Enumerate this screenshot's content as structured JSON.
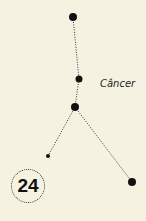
{
  "constellation": {
    "name": "Câncer",
    "stars": [
      {
        "x": 73,
        "y": 17,
        "r": 4
      },
      {
        "x": 79,
        "y": 79,
        "r": 3.5
      },
      {
        "x": 75,
        "y": 107,
        "r": 4
      },
      {
        "x": 48,
        "y": 156,
        "r": 2
      },
      {
        "x": 132,
        "y": 182,
        "r": 4
      }
    ],
    "lines": [
      [
        0,
        1
      ],
      [
        1,
        2
      ],
      [
        2,
        3
      ],
      [
        2,
        4
      ]
    ],
    "star_color": "#111111",
    "line_color": "#333333"
  },
  "badge": {
    "number": "24"
  },
  "background_color": "#f6f2e2"
}
